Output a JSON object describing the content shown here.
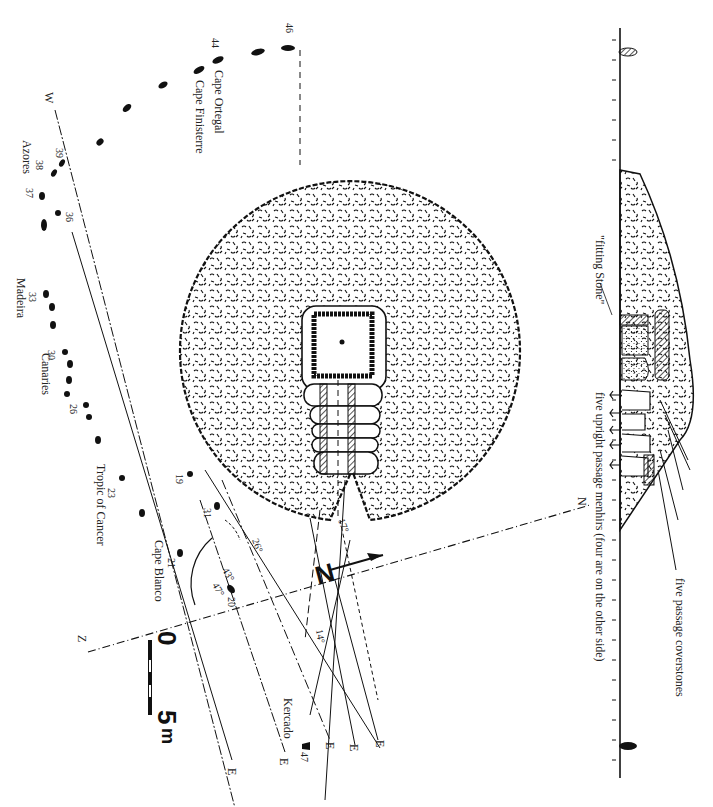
{
  "section": {
    "labels": {
      "fitting_stone": "\"fitting Stone\"",
      "upright_menhirs": "five upright passage menhirs (four are on the other side)",
      "coverstones": "five passage coverstones"
    }
  },
  "plan": {
    "kercado_label": "Kercado",
    "kercado_number": "47"
  },
  "coast_points": {
    "cape_ortegal": "Cape Ortegal",
    "cape_finisterre": "Cape Finisterre",
    "azores": "Azores",
    "madeira": "Madeira",
    "canaries": "Canaries",
    "tropic_of_cancer": "Tropic of Cancer",
    "cape_blanco": "Cape Blanco",
    "latitudes": [
      "46",
      "44",
      "39",
      "38",
      "37",
      "36",
      "33",
      "30",
      "26",
      "23",
      "21",
      "20",
      "19",
      "31"
    ]
  },
  "cardinal": {
    "north": "N",
    "south": "Z",
    "west": "W",
    "east": "E",
    "north_arrow": "N"
  },
  "angles": {
    "a17": "17°",
    "a26": "26°",
    "a43": "43°",
    "a47": "47°",
    "a14": "14°"
  },
  "scale": {
    "zero": "0",
    "five": "5",
    "unit": "m"
  }
}
